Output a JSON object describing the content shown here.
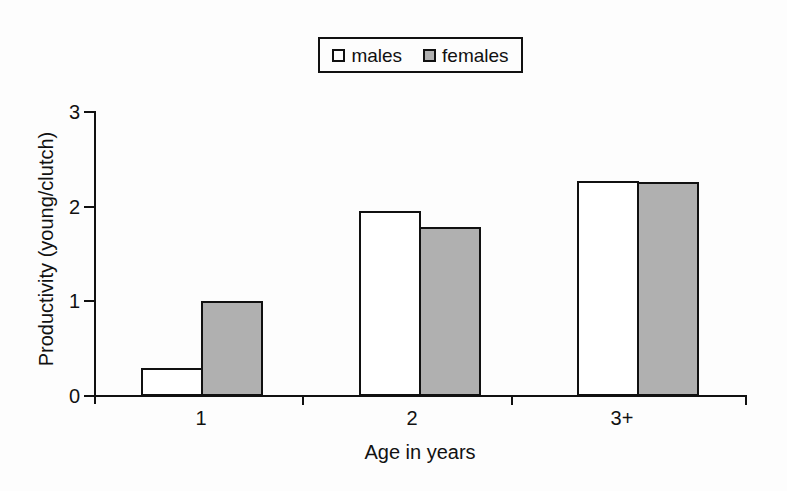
{
  "chart_data": {
    "type": "bar",
    "title": "",
    "categories": [
      "1",
      "2",
      "3+"
    ],
    "series": [
      {
        "name": "males",
        "values": [
          0.3,
          1.95,
          2.27
        ],
        "fill": "#ffffff"
      },
      {
        "name": "females",
        "values": [
          1.0,
          1.78,
          2.26
        ],
        "fill": "#b0b0b0"
      }
    ],
    "xlabel": "Age in years",
    "ylabel": "Productivity (young/clutch)",
    "ylim": [
      0,
      3
    ],
    "yticks": [
      "0",
      "1",
      "2",
      "3"
    ],
    "grid": false,
    "legend_position": "top-center",
    "bar_edge_color": "#111111"
  },
  "colors": {
    "background": "#fdfdfd",
    "axis": "#111111",
    "text": "#111111",
    "male_bar_fill": "#ffffff",
    "female_bar_fill": "#b0b0b0"
  }
}
